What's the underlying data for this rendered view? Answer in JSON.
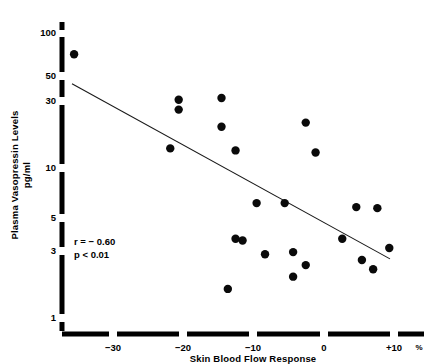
{
  "chart_data": {
    "type": "scatter",
    "title": "",
    "xlabel": "Skin Blood Flow Response",
    "xunit": "%",
    "ylabel": "Plasma Vasopressin Levels",
    "yunit": "pg/ml",
    "yscale": "log",
    "xlim": [
      -36.5,
      15.5
    ],
    "ylim": [
      1,
      130
    ],
    "grid": false,
    "legend": null,
    "xticks": [
      -30,
      -20,
      -10,
      0,
      10
    ],
    "xticklabels": [
      "−30",
      "−20",
      "−10",
      "0",
      "+10"
    ],
    "yticks": [
      1,
      3,
      5,
      10,
      30,
      50,
      100
    ],
    "yticklabels": [
      "1",
      "3",
      "5",
      "10",
      "30",
      "50",
      "100"
    ],
    "points": [
      {
        "x": -35.6,
        "y": 71.0
      },
      {
        "x": -20.7,
        "y": 34.0
      },
      {
        "x": -20.7,
        "y": 29.0
      },
      {
        "x": -14.6,
        "y": 35.0
      },
      {
        "x": -14.6,
        "y": 22.0
      },
      {
        "x": -12.6,
        "y": 15.0
      },
      {
        "x": -21.9,
        "y": 15.5
      },
      {
        "x": -2.6,
        "y": 23.5
      },
      {
        "x": -1.2,
        "y": 14.5
      },
      {
        "x": -9.6,
        "y": 6.4
      },
      {
        "x": -5.6,
        "y": 6.4
      },
      {
        "x": 4.6,
        "y": 6.0
      },
      {
        "x": 7.6,
        "y": 5.9
      },
      {
        "x": -12.6,
        "y": 3.6
      },
      {
        "x": -11.6,
        "y": 3.5
      },
      {
        "x": 2.6,
        "y": 3.6
      },
      {
        "x": -8.4,
        "y": 2.8
      },
      {
        "x": -4.4,
        "y": 2.9
      },
      {
        "x": -2.6,
        "y": 2.35
      },
      {
        "x": 9.3,
        "y": 3.1
      },
      {
        "x": 5.4,
        "y": 2.55
      },
      {
        "x": 7.0,
        "y": 2.2
      },
      {
        "x": -4.4,
        "y": 1.95
      },
      {
        "x": -13.7,
        "y": 1.6
      }
    ],
    "fit_line": {
      "x_start": -35.9,
      "y_start": 44.0,
      "x_end": 9.4,
      "y_end": 2.6
    },
    "annotations": [
      {
        "text": "r = − 0.60"
      },
      {
        "text": "p < 0.01"
      }
    ]
  },
  "annotation_lines": {
    "r_value": "r = − 0.60",
    "p_value": "p < 0.01"
  },
  "axes": {
    "y_title_line1": "Plasma Vasopressin Levels",
    "y_title_line2": "pg/ml",
    "x_title": "Skin Blood Flow Response",
    "x_unit_symbol": "%"
  },
  "ytick_labels": {
    "t100": "100",
    "t50": "50",
    "t30": "30",
    "t10": "10",
    "t5": "5",
    "t3": "3",
    "t1": "1"
  },
  "xtick_labels": {
    "m30": "−30",
    "m20": "−20",
    "m10": "−10",
    "z0": "0",
    "p10": "+10"
  }
}
